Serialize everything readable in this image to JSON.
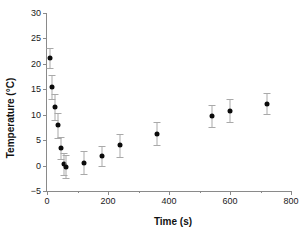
{
  "chart_data": {
    "type": "scatter",
    "title": "",
    "xlabel": "Time (s)",
    "ylabel": "Temperature (°C)",
    "xlim": [
      0,
      800
    ],
    "ylim": [
      -5,
      30
    ],
    "xticks": [
      0,
      200,
      400,
      600,
      800
    ],
    "xtick_labels": [
      "0",
      "200",
      "400",
      "600",
      "800"
    ],
    "xticks_minor": [
      100,
      300,
      500,
      700
    ],
    "yticks": [
      -5,
      0,
      5,
      10,
      15,
      20,
      25,
      30
    ],
    "ytick_labels": [
      "−5",
      "0",
      "5",
      "10",
      "15",
      "20",
      "25",
      "30"
    ],
    "grid": false,
    "legend": null,
    "marker_color": "#0b0b0b",
    "errorbar_color": "#a9a9a9",
    "axis_color": "#8a8a8a",
    "series": [
      {
        "name": "Temperature",
        "x": [
          10,
          15,
          25,
          35,
          45,
          55,
          62,
          120,
          180,
          240,
          360,
          540,
          600,
          720
        ],
        "y": [
          21.2,
          15.4,
          11.5,
          7.9,
          3.4,
          0.3,
          -0.2,
          0.6,
          1.9,
          4.0,
          6.3,
          9.8,
          10.8,
          12.2
        ],
        "yerr": [
          2.0,
          2.4,
          2.6,
          2.4,
          2.2,
          2.2,
          2.2,
          2.2,
          2.0,
          2.3,
          2.3,
          2.2,
          2.3,
          2.1
        ]
      }
    ]
  }
}
